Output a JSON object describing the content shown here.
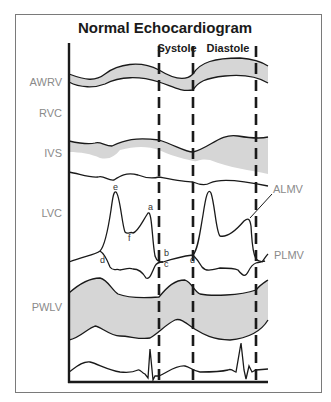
{
  "title": "Normal Echocardiogram",
  "phases": {
    "systole": "Systole",
    "diastole": "Diastole"
  },
  "structures": [
    {
      "abbr": "AWRV",
      "y": 86
    },
    {
      "abbr": "RVC",
      "y": 117
    },
    {
      "abbr": "IVS",
      "y": 157
    },
    {
      "abbr": "LVC",
      "y": 217
    },
    {
      "abbr": "PWLV",
      "y": 311
    }
  ],
  "valve_labels": {
    "anterior": "ALMV",
    "posterior": "PLMV"
  },
  "mitral_points": [
    "a",
    "b",
    "c",
    "d",
    "e",
    "f"
  ],
  "colors": {
    "band_fill": "#d6d6d6",
    "line": "#1a1a1a",
    "label": "#8a8a8a",
    "frame": "#7a7a7a"
  }
}
